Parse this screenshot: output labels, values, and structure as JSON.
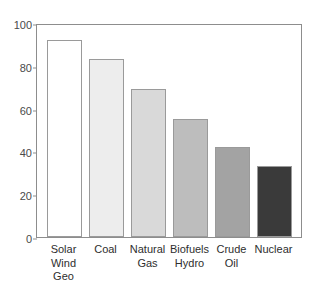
{
  "chart_data": {
    "type": "bar",
    "title": "",
    "subtitle": "",
    "xlabel": "",
    "ylabel": "",
    "ylim": [
      0,
      100
    ],
    "yticks": [
      0,
      20,
      40,
      60,
      80,
      100
    ],
    "grid": false,
    "legend": "none",
    "categories": [
      "Solar\nWind\nGeo",
      "Coal",
      "Natural\nGas",
      "Biofuels\nHydro",
      "Crude\nOil",
      "Nuclear"
    ],
    "values": [
      92,
      83,
      69,
      55,
      42,
      33
    ],
    "bar_colors": [
      "#ffffff",
      "#ededed",
      "#d9d9d9",
      "#bdbdbd",
      "#a3a3a3",
      "#3a3a3a"
    ],
    "bar_edge_color": "#9a9a9a",
    "axis_color": "#8d8d8d",
    "tick_label_color": "#4a4a4a",
    "category_label_color": "#2e2e2e",
    "background": "#ffffff"
  }
}
